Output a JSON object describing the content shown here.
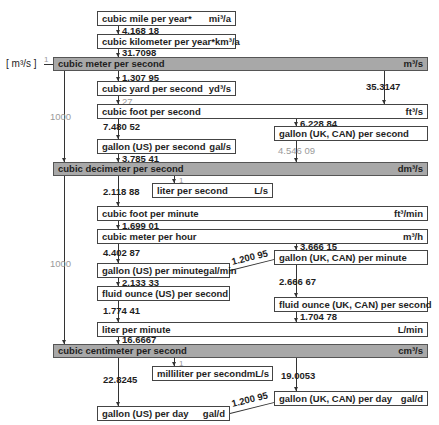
{
  "base_unit": {
    "symbol": "m³/s",
    "factor": "1"
  },
  "bars": [
    {
      "label": "cubic meter per second",
      "unit": "m³/s"
    },
    {
      "label": "cubic decimeter per second",
      "unit": "dm³/s"
    },
    {
      "label": "cubic centimeter per second",
      "unit": "cm³/s"
    }
  ],
  "boxes": {
    "mi3a": {
      "label": "cubic mile per year*",
      "unit": "mi³/a"
    },
    "km3a": {
      "label": "cubic kilometer per year*",
      "unit": "km³/a"
    },
    "yd3s": {
      "label": "cubic yard per second",
      "unit": "yd³/s"
    },
    "ft3s": {
      "label": "cubic foot per second",
      "unit": "ft³/s"
    },
    "galuks": {
      "label": "gallon (UK, CAN) per second",
      "unit": ""
    },
    "galuss": {
      "label": "gallon (US) per second",
      "unit": "gal/s"
    },
    "ls": {
      "label": "liter per second",
      "unit": "L/s"
    },
    "ft3min": {
      "label": "cubic foot per minute",
      "unit": "ft³/min"
    },
    "m3h": {
      "label": "cubic meter per hour",
      "unit": "m³/h"
    },
    "galukmin": {
      "label": "gallon (UK, CAN) per minute",
      "unit": ""
    },
    "galusmin": {
      "label": "gallon (US) per minute",
      "unit": "gal/min"
    },
    "flozuss": {
      "label": "fluid ounce (US) per second",
      "unit": ""
    },
    "flozuks": {
      "label": "fluid ounce (UK, CAN) per second",
      "unit": ""
    },
    "lmin": {
      "label": "liter per minute",
      "unit": "L/min"
    },
    "mls": {
      "label": "milliliter per second",
      "unit": "mL/s"
    },
    "galusd": {
      "label": "gallon (US) per day",
      "unit": "gal/d"
    },
    "galukd": {
      "label": "gallon (UK, CAN) per day",
      "unit": "gal/d"
    }
  },
  "factors": {
    "mi3a_km3a": "4.168 18",
    "km3a_m3s": "31.7098",
    "m3s_yd3s": "1.307 95",
    "yd3s_ft3s": "27",
    "m3s_ft3s": "35.3147",
    "m3s_dm3s": "1000",
    "ft3s_galuks": "6.228 84",
    "ft3s_galuss": "7.480 52",
    "galuks_dm3s": "4.546 09",
    "galuss_dm3s": "3.785 41",
    "dm3s_ls": "1",
    "dm3s_ft3min": "2.118 88",
    "ft3min_m3h": "1.699 01",
    "m3h_galusmin": "4.402 87",
    "m3h_galukmin": "3.666 15",
    "galusmin_galukmin": "1.200 95",
    "galusmin_flozuss": "2.133 33",
    "galukmin_flozuks": "2.666 67",
    "dm3s_cm3s": "1000",
    "flozuss_lmin": "1.774 41",
    "flozuks_lmin": "1.704 78",
    "lmin_cm3s": "16.6667",
    "cm3s_mls": "1",
    "cm3s_galusd": "22.8245",
    "cm3s_galukd": "19.0053",
    "galusd_galukd": "1.200 95"
  }
}
